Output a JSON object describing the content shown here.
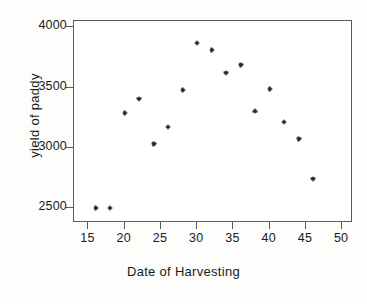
{
  "chart_data": {
    "type": "scatter",
    "title": "",
    "xlabel": "Date of Harvesting",
    "ylabel": "yield of paddy",
    "xlim": [
      13,
      51.5
    ],
    "ylim": [
      2380,
      4050
    ],
    "grid": false,
    "legend": null,
    "xticks": [
      15,
      20,
      25,
      30,
      35,
      40,
      45,
      50
    ],
    "xtick_labels": [
      "15",
      "20",
      "25",
      "30",
      "35",
      "40",
      "45",
      "50"
    ],
    "yticks": [
      2500,
      3000,
      3500,
      4000
    ],
    "ytick_labels": [
      "2500",
      "3000",
      "3500",
      "4000"
    ],
    "marker": "star",
    "marker_color": "#121212",
    "series": [
      {
        "name": "yield of paddy",
        "x": [
          16,
          18,
          20,
          22,
          24,
          26,
          28,
          30,
          32,
          34,
          36,
          38,
          40,
          42,
          44,
          46
        ],
        "y": [
          2503,
          2503,
          3287,
          3408,
          3037,
          3174,
          3480,
          3867,
          3810,
          3623,
          3690,
          3303,
          3488,
          3214,
          3077,
          2747
        ]
      }
    ]
  },
  "axes": {
    "frame_color": "#5a5a5a",
    "text_color": "#1a1a1a"
  }
}
